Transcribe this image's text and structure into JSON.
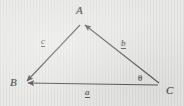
{
  "figure": {
    "kind": "vector-triangle-diagram",
    "background_color": "#e8e8e6",
    "line_color": "#5a5a5a",
    "vertices": [
      {
        "id": "A",
        "label": "A",
        "x": 82,
        "y": 22
      },
      {
        "id": "B",
        "label": "B",
        "x": 23,
        "y": 83
      },
      {
        "id": "C",
        "label": "C",
        "x": 161,
        "y": 85
      }
    ],
    "vectors": [
      {
        "id": "a",
        "label": "a",
        "from": "C",
        "to": "B",
        "arrowhead_at": "B",
        "notation": "underlined"
      },
      {
        "id": "b",
        "label": "b",
        "from": "C",
        "to": "A",
        "arrowhead_at": "A",
        "notation": "underlined"
      },
      {
        "id": "c",
        "label": "c",
        "from": "A",
        "to": "B",
        "arrowhead_at": "B",
        "notation": "underlined"
      }
    ],
    "angles": [
      {
        "id": "theta",
        "label": "θ",
        "at_vertex": "C",
        "between": [
          "a",
          "b"
        ]
      }
    ]
  }
}
